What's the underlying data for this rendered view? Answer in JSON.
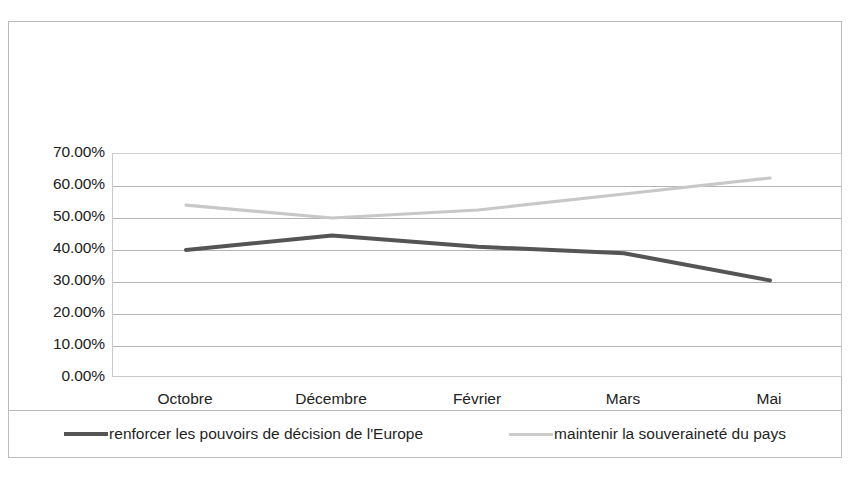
{
  "chart_data": {
    "type": "line",
    "title": "",
    "xlabel": "",
    "ylabel": "",
    "categories": [
      "Octobre",
      "Décembre",
      "Février",
      "Mars",
      "Mai"
    ],
    "ylim": [
      0,
      70
    ],
    "ytick_labels": [
      "70.00%",
      "60.00%",
      "50.00%",
      "40.00%",
      "30.00%",
      "20.00%",
      "10.00%",
      "0.00%"
    ],
    "ytick_values": [
      70,
      60,
      50,
      40,
      30,
      20,
      10,
      0
    ],
    "grid": true,
    "legend_position": "bottom",
    "series": [
      {
        "name": "renforcer les pouvoirs de décision de l'Europe",
        "color": "#555555",
        "values": [
          40,
          44.5,
          41,
          39,
          30.5
        ]
      },
      {
        "name": "maintenir la souveraineté du pays",
        "color": "#c8c8c8",
        "values": [
          54,
          50,
          52.5,
          57.5,
          62.5
        ]
      }
    ]
  },
  "legend": {
    "items": [
      {
        "label": "renforcer les pouvoirs de décision de l'Europe",
        "swatch_color": "#555555",
        "swatch_name": "legend-swatch-dark"
      },
      {
        "label": "maintenir la souveraineté du pays",
        "swatch_color": "#cccccc",
        "swatch_name": "legend-swatch-light"
      }
    ]
  },
  "colors": {
    "series_dark": "#555555",
    "series_light": "#c8c8c8",
    "gridline": "#b5b5b5",
    "frame": "#b9b9b9",
    "background": "#ffffff"
  }
}
